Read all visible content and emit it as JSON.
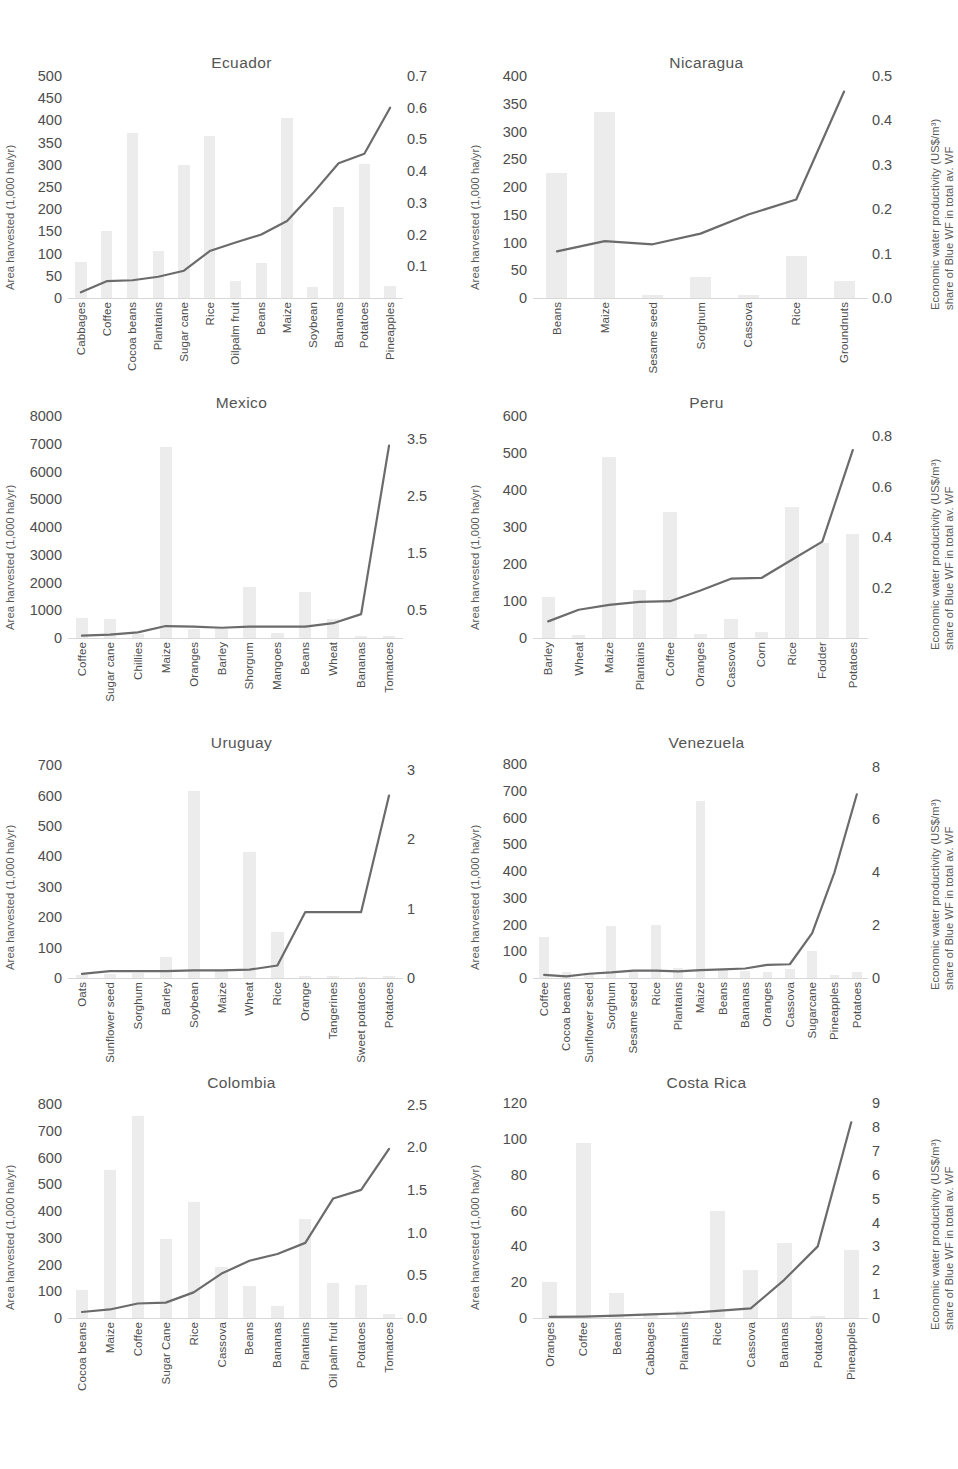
{
  "axis_titles": {
    "left": "Area harvested (1,000 ha/yr)",
    "right_line1": "Economic water productivity (US$/m³)",
    "right_line2": "share of  Blue WF in total av. WF"
  },
  "chart_data": [
    {
      "type": "bar",
      "title": "Ecuador",
      "xlabel": "",
      "ylabel": "Area harvested (1,000 ha/yr)",
      "y2label": "Economic water productivity (US$/m³) share of Blue WF in total av. WF",
      "grid": false,
      "legend": "none",
      "categories": [
        "Cabbages",
        "Coffee",
        "Cocoa beans",
        "Plantains",
        "Sugar cane",
        "Rice",
        "Oilpalm fruit",
        "Beans",
        "Maize",
        "Soybean",
        "Bananas",
        "Potatoes",
        "Pineapples"
      ],
      "values": [
        80,
        150,
        372,
        105,
        300,
        365,
        38,
        78,
        405,
        25,
        205,
        302,
        28
      ],
      "ylim": [
        0,
        500
      ],
      "yticks": [
        0,
        50,
        100,
        150,
        200,
        250,
        300,
        350,
        400,
        450,
        500
      ],
      "y2lim": [
        0,
        0.7
      ],
      "y2ticks": [
        0.1,
        0.2,
        0.3,
        0.4,
        0.5,
        0.6,
        0.7
      ],
      "series": [
        {
          "name": "Economic water productivity",
          "values": [
            0.018,
            0.053,
            0.056,
            0.067,
            0.086,
            0.148,
            0.175,
            0.2,
            0.243,
            0.33,
            0.425,
            0.455,
            0.6
          ]
        }
      ]
    },
    {
      "type": "bar",
      "title": "Nicaragua",
      "xlabel": "",
      "ylabel": "Area harvested (1,000 ha/yr)",
      "y2label": "Economic water productivity (US$/m³) share of Blue WF in total av. WF",
      "grid": false,
      "legend": "none",
      "categories": [
        "Beans",
        "Maize",
        "Sesame seed",
        "Sorghum",
        "Cassova",
        "Rice",
        "Groundnuts"
      ],
      "values": [
        225,
        335,
        5,
        38,
        6,
        76,
        30
      ],
      "ylim": [
        0,
        400
      ],
      "yticks": [
        0,
        50,
        100,
        150,
        200,
        250,
        300,
        350,
        400
      ],
      "y2lim": [
        0,
        0.5
      ],
      "y2ticks": [
        0,
        0.1,
        0.2,
        0.3,
        0.4,
        0.5
      ],
      "series": [
        {
          "name": "Economic water productivity",
          "values": [
            0.105,
            0.128,
            0.121,
            0.145,
            0.188,
            0.222,
            0.465
          ]
        }
      ]
    },
    {
      "type": "bar",
      "title": "Mexico",
      "xlabel": "",
      "ylabel": "Area harvested (1,000 ha/yr)",
      "y2label": "Economic water productivity (US$/m³) share of Blue WF in total av. WF",
      "grid": false,
      "legend": "none",
      "categories": [
        "Coffee",
        "Sugar cane",
        "Chillies",
        "Maize",
        "Oranges",
        "Barley",
        "Shorgum",
        "Mangoes",
        "Beans",
        "Wheat",
        "Bananas",
        "Tomatoes"
      ],
      "values": [
        720,
        680,
        160,
        6900,
        330,
        320,
        1850,
        190,
        1650,
        680,
        75,
        60
      ],
      "ylim": [
        0,
        8000
      ],
      "yticks": [
        0,
        1000,
        2000,
        3000,
        4000,
        5000,
        6000,
        7000,
        8000
      ],
      "y2lim": [
        0,
        3.9
      ],
      "y2ticks": [
        0.5,
        1.5,
        2.5,
        3.5
      ],
      "series": [
        {
          "name": "Economic water productivity",
          "values": [
            0.04,
            0.06,
            0.1,
            0.21,
            0.2,
            0.18,
            0.2,
            0.2,
            0.2,
            0.26,
            0.42,
            3.38
          ]
        }
      ]
    },
    {
      "type": "bar",
      "title": "Peru",
      "xlabel": "",
      "ylabel": "Area harvested (1,000 ha/yr)",
      "y2label": "Economic water productivity (US$/m³) share of Blue WF in total av. WF",
      "grid": false,
      "legend": "none",
      "categories": [
        "Barley",
        "Wheat",
        "Maize",
        "Plantains",
        "Coffee",
        "Oranges",
        "Cassova",
        "Corn",
        "Rice",
        "Fodder",
        "Potatoes"
      ],
      "values": [
        110,
        8,
        490,
        130,
        340,
        12,
        52,
        16,
        355,
        258,
        282
      ],
      "ylim": [
        0,
        600
      ],
      "yticks": [
        0,
        100,
        200,
        300,
        400,
        500,
        600
      ],
      "y2lim": [
        0,
        0.88
      ],
      "y2ticks": [
        0.2,
        0.4,
        0.6,
        0.8
      ],
      "series": [
        {
          "name": "Economic water productivity",
          "values": [
            0.066,
            0.112,
            0.131,
            0.143,
            0.146,
            0.188,
            0.235,
            0.238,
            0.31,
            0.382,
            0.745
          ]
        }
      ]
    },
    {
      "type": "bar",
      "title": "Uruguay",
      "xlabel": "",
      "ylabel": "Area harvested (1,000 ha/yr)",
      "y2label": "Economic water productivity (US$/m³) share of Blue WF in total av. WF",
      "grid": false,
      "legend": "none",
      "categories": [
        "Oats",
        "Sunflower seed",
        "Sorghum",
        "Barley",
        "Soybean",
        "Maize",
        "Wheat",
        "Rice",
        "Orange",
        "Tangerines",
        "Sweet potatoes",
        "Potatoes"
      ],
      "values": [
        10,
        14,
        18,
        70,
        615,
        26,
        415,
        150,
        8,
        6,
        3,
        5
      ],
      "ylim": [
        0,
        730
      ],
      "yticks": [
        0,
        100,
        200,
        300,
        400,
        500,
        600,
        700
      ],
      "y2lim": [
        0,
        3.2
      ],
      "y2ticks": [
        0.0,
        1.0,
        2.0,
        3.0
      ],
      "series": [
        {
          "name": "Economic water productivity",
          "values": [
            0.06,
            0.1,
            0.1,
            0.1,
            0.11,
            0.11,
            0.12,
            0.18,
            0.95,
            0.95,
            0.95,
            2.63
          ]
        }
      ]
    },
    {
      "type": "bar",
      "title": "Venezuela",
      "xlabel": "",
      "ylabel": "Area harvested (1,000 ha/yr)",
      "y2label": "Economic water productivity (US$/m³) share of Blue WF in total av. WF",
      "grid": false,
      "legend": "none",
      "categories": [
        "Coffee",
        "Cocoa beans",
        "Sunflower seed",
        "Sorghum",
        "Sesame seed",
        "Rice",
        "Plantains",
        "Maize",
        "Beans",
        "Bananas",
        "Oranges",
        "Cassova",
        "Sugarcane",
        "Pineapples",
        "Potatoes"
      ],
      "values": [
        155,
        22,
        18,
        195,
        25,
        200,
        38,
        660,
        30,
        28,
        22,
        32,
        100,
        10,
        22
      ],
      "ylim": [
        0,
        830
      ],
      "yticks": [
        0,
        100,
        200,
        300,
        400,
        500,
        600,
        700,
        800
      ],
      "y2lim": [
        0,
        8.4
      ],
      "y2ticks": [
        0.0,
        2.0,
        4.0,
        6.0,
        8.0
      ],
      "series": [
        {
          "name": "Economic water productivity",
          "values": [
            0.12,
            0.06,
            0.16,
            0.21,
            0.28,
            0.28,
            0.25,
            0.3,
            0.33,
            0.36,
            0.5,
            0.52,
            1.7,
            4.0,
            6.95
          ]
        }
      ]
    },
    {
      "type": "bar",
      "title": "Colombia",
      "xlabel": "",
      "ylabel": "Area harvested (1,000 ha/yr)",
      "y2label": "Economic water productivity (US$/m³) share of Blue WF in total av. WF",
      "grid": false,
      "legend": "none",
      "categories": [
        "Cocoa beans",
        "Maize",
        "Coffee",
        "Sugar Cane",
        "Rice",
        "Cassova",
        "Beans",
        "Bananas",
        "Plantains",
        "Oil palm fruit",
        "Potatoes",
        "Tomatoes"
      ],
      "values": [
        105,
        555,
        755,
        295,
        435,
        190,
        120,
        45,
        370,
        130,
        125,
        15
      ],
      "ylim": [
        0,
        830
      ],
      "yticks": [
        0,
        100,
        200,
        300,
        400,
        500,
        600,
        700,
        800
      ],
      "y2lim": [
        0,
        2.6
      ],
      "y2ticks": [
        0.0,
        0.5,
        1.0,
        1.5,
        2.0,
        2.5
      ],
      "series": [
        {
          "name": "Economic water productivity",
          "values": [
            0.07,
            0.1,
            0.17,
            0.18,
            0.3,
            0.52,
            0.67,
            0.75,
            0.88,
            1.4,
            1.5,
            1.98
          ]
        }
      ]
    },
    {
      "type": "bar",
      "title": "Costa Rica",
      "xlabel": "",
      "ylabel": "Area harvested (1,000 ha/yr)",
      "y2label": "Economic water productivity (US$/m³) share of Blue WF in total av. WF",
      "grid": false,
      "legend": "none",
      "categories": [
        "Oranges",
        "Coffee",
        "Beans",
        "Cabbages",
        "Plantains",
        "Rice",
        "Cassova",
        "Bananas",
        "Potatoes",
        "Pineapples"
      ],
      "values": [
        20,
        98,
        14,
        2,
        4,
        60,
        27,
        42,
        1,
        38
      ],
      "ylim": [
        0,
        124
      ],
      "yticks": [
        0,
        20,
        40,
        60,
        80,
        100,
        120
      ],
      "y2lim": [
        0,
        9.3
      ],
      "y2ticks": [
        0.0,
        1.0,
        2.0,
        3.0,
        4.0,
        5.0,
        6.0,
        7.0,
        8.0,
        9.0
      ],
      "series": [
        {
          "name": "Economic water productivity",
          "values": [
            0.05,
            0.06,
            0.1,
            0.15,
            0.2,
            0.3,
            0.4,
            1.6,
            3.0,
            8.2
          ]
        }
      ]
    }
  ]
}
